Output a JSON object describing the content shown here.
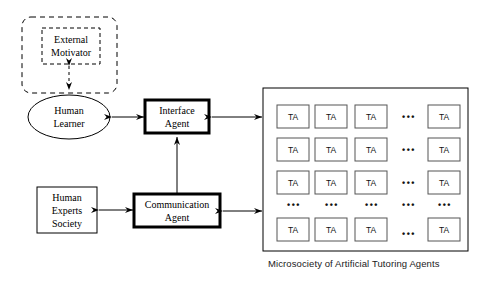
{
  "diagram": {
    "colors": {
      "stroke": "#000000",
      "background": "#ffffff",
      "ta_box_stroke": "#555555",
      "caption_color": "#1a1a1a"
    },
    "nodes": {
      "external_container": {
        "label": "",
        "shape": "rounded-dashed-rect"
      },
      "external_motivator": {
        "line1": "External",
        "line2": "Motivator",
        "shape": "dashed-rect"
      },
      "human_learner": {
        "line1": "Human",
        "line2": "Learner",
        "shape": "ellipse"
      },
      "interface_agent": {
        "line1": "Interface",
        "line2": "Agent",
        "shape": "thick-rect"
      },
      "communication_agent": {
        "line1": "Communication",
        "line2": "Agent",
        "shape": "thick-rect"
      },
      "human_experts_society": {
        "line1": "Human",
        "line2": "Experts",
        "line3": "Society",
        "shape": "rect"
      },
      "microsociety": {
        "caption": "Microsociety of Artificial Tutoring Agents",
        "shape": "rect"
      }
    },
    "ta_grid": {
      "agent_label": "TA",
      "dots": "• • •",
      "rows": [
        {
          "type": "agents",
          "cells": [
            "TA",
            "TA",
            "TA",
            "dots",
            "TA"
          ]
        },
        {
          "type": "agents",
          "cells": [
            "TA",
            "TA",
            "TA",
            "dots",
            "TA"
          ]
        },
        {
          "type": "agents",
          "cells": [
            "TA",
            "TA",
            "TA",
            "dots",
            "TA"
          ]
        },
        {
          "type": "dots",
          "cells": [
            "dots",
            "dots",
            "dots",
            "dots",
            "dots"
          ]
        },
        {
          "type": "agents",
          "cells": [
            "TA",
            "TA",
            "TA",
            "dots",
            "TA"
          ]
        }
      ]
    },
    "connections": [
      {
        "from": "external_motivator",
        "to": "human_learner",
        "style": "dashed",
        "arrows": "both"
      },
      {
        "from": "human_learner",
        "to": "interface_agent",
        "style": "solid",
        "arrows": "both"
      },
      {
        "from": "interface_agent",
        "to": "microsociety",
        "style": "solid",
        "arrows": "both"
      },
      {
        "from": "communication_agent",
        "to": "interface_agent",
        "style": "solid",
        "arrows": "up"
      },
      {
        "from": "human_experts_society",
        "to": "communication_agent",
        "style": "solid",
        "arrows": "both"
      },
      {
        "from": "communication_agent",
        "to": "microsociety",
        "style": "solid",
        "arrows": "both"
      }
    ]
  }
}
